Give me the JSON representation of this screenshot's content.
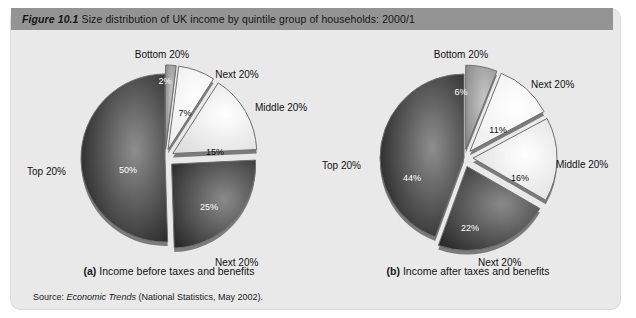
{
  "figure": {
    "number": "Figure 10.1",
    "title": "Size distribution of UK income by quintile group of households: 2000/1",
    "source_prefix": "Source: ",
    "source_italic": "Economic Trends",
    "source_rest": " (National Statistics, May 2002)."
  },
  "colors": {
    "title_bar": "#949494",
    "panel_background": "#e9e9e9",
    "dark_slice": "#2b2b2b",
    "mid_dark_slice": "#3d3d3d",
    "mid_slice": "#9a9a9a",
    "light_slice": "#f2f2f2",
    "white_slice": "#fbfbfb",
    "slice_edge": "#6f6f6f",
    "text": "#141414"
  },
  "chart_data": [
    {
      "type": "pie",
      "id": "income-before-taxes",
      "panel_letter": "(a)",
      "caption": "Income before taxes and benefits",
      "title": "Income before taxes and benefits",
      "categories": [
        "Bottom 20%",
        "Next 20%",
        "Middle 20%",
        "Next 20%",
        "Top 20%"
      ],
      "values": [
        2,
        7,
        15,
        25,
        50
      ],
      "value_labels": [
        "2%",
        "7%",
        "15%",
        "25%",
        "50%"
      ],
      "unit": "percent",
      "exploded": [
        true,
        true,
        true,
        true,
        false
      ],
      "legend_position": "callout-labels",
      "slice_shades": [
        "mid",
        "white",
        "light",
        "mid_dark",
        "dark"
      ],
      "callouts": [
        {
          "label": "Bottom 20%",
          "x": 143,
          "y": 8,
          "anchor": "middle"
        },
        {
          "label": "Next 20%",
          "x": 218,
          "y": 28,
          "anchor": "middle"
        },
        {
          "label": "Middle 20%",
          "x": 236,
          "y": 61,
          "anchor": "start"
        },
        {
          "label": "Next 20%",
          "x": 196,
          "y": 216,
          "anchor": "start"
        },
        {
          "label": "Top 20%",
          "x": 8,
          "y": 125,
          "anchor": "start"
        }
      ],
      "value_positions": [
        {
          "text": "2%",
          "x": 146,
          "y": 41,
          "dark": true
        },
        {
          "text": "7%",
          "x": 166,
          "y": 73,
          "dark": false
        },
        {
          "text": "15%",
          "x": 196,
          "y": 112,
          "dark": false
        },
        {
          "text": "25%",
          "x": 190,
          "y": 167,
          "dark": true
        },
        {
          "text": "50%",
          "x": 109,
          "y": 130,
          "dark": true
        }
      ]
    },
    {
      "type": "pie",
      "id": "income-after-taxes",
      "panel_letter": "(b)",
      "caption": "Income after taxes and benefits",
      "title": "Income after taxes and benefits",
      "categories": [
        "Bottom 20%",
        "Next 20%",
        "Middle 20%",
        "Next 20%",
        "Top 20%"
      ],
      "values": [
        6,
        11,
        16,
        22,
        44
      ],
      "value_labels": [
        "6%",
        "11%",
        "16%",
        "22%",
        "44%"
      ],
      "unit": "percent",
      "exploded": [
        true,
        true,
        true,
        true,
        false
      ],
      "legend_position": "callout-labels",
      "slice_shades": [
        "mid",
        "white",
        "light",
        "mid_dark",
        "dark"
      ],
      "callouts": [
        {
          "label": "Bottom 20%",
          "x": 143,
          "y": 8,
          "anchor": "middle"
        },
        {
          "label": "Next 20%",
          "x": 213,
          "y": 38,
          "anchor": "start"
        },
        {
          "label": "Middle 20%",
          "x": 238,
          "y": 118,
          "anchor": "start"
        },
        {
          "label": "Next 20%",
          "x": 160,
          "y": 216,
          "anchor": "start"
        },
        {
          "label": "Top 20%",
          "x": 4,
          "y": 119,
          "anchor": "start"
        }
      ],
      "value_positions": [
        {
          "text": "6%",
          "x": 143,
          "y": 52,
          "dark": true
        },
        {
          "text": "11%",
          "x": 180,
          "y": 90,
          "dark": false
        },
        {
          "text": "16%",
          "x": 202,
          "y": 138,
          "dark": false
        },
        {
          "text": "22%",
          "x": 152,
          "y": 188,
          "dark": true
        },
        {
          "text": "44%",
          "x": 94,
          "y": 138,
          "dark": true
        }
      ]
    }
  ]
}
